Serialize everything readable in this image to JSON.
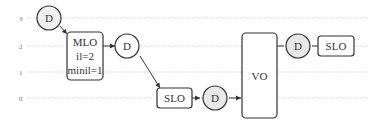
{
  "diagram": {
    "y_axis": {
      "ticks": [
        {
          "label": "3",
          "y": 18
        },
        {
          "label": "2",
          "y": 46
        },
        {
          "label": "1",
          "y": 72
        },
        {
          "label": "0",
          "y": 98
        }
      ]
    },
    "nodes": {
      "d_top": {
        "label": "D",
        "shape": "circle",
        "fill": "#f0f0f0"
      },
      "mlo": {
        "line1": "MLO",
        "line2": "il=2",
        "line3": "minil=1",
        "shape": "rounded-rect"
      },
      "d_mid": {
        "label": "D",
        "shape": "circle",
        "fill": "#ffffff"
      },
      "slo_low": {
        "label": "SLO",
        "shape": "rounded-rect"
      },
      "d_low": {
        "label": "D",
        "shape": "circle",
        "fill": "#e8e8e8"
      },
      "vo": {
        "label": "VO",
        "shape": "tall-rounded-rect"
      },
      "d_right": {
        "label": "D",
        "shape": "circle",
        "fill": "#e8e8e8"
      },
      "slo_right": {
        "label": "SLO",
        "shape": "rounded-rect"
      }
    },
    "colors": {
      "stroke": "#333333",
      "grid": "#c8c8c8",
      "shaded_circle": "#e8e8e8"
    }
  }
}
